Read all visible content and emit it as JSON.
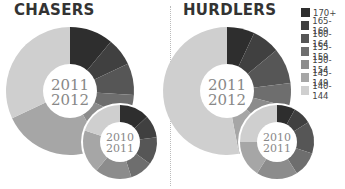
{
  "chart_data": {
    "type": "pie",
    "style": "donut",
    "legend": {
      "position": "right-top",
      "entries": [
        "170+",
        "165-169",
        "160-164",
        "155-159",
        "150-154",
        "145-149",
        "140-144"
      ],
      "colors": [
        "#2e2e2e",
        "#404040",
        "#565656",
        "#6e6e6e",
        "#8c8c8c",
        "#a6a6a6",
        "#cfcfcf"
      ]
    },
    "panels": [
      {
        "title": "CHASERS",
        "charts": [
          {
            "label_line1": "2011",
            "label_line2": "2012",
            "season": "2011/2012",
            "values": [
              11,
              7,
              8,
              6,
              10,
              26,
              32
            ]
          },
          {
            "label_line1": "2010",
            "label_line2": "2011",
            "season": "2010/2011",
            "values": [
              13,
              10,
              12,
              10,
              16,
              19,
              20
            ]
          }
        ]
      },
      {
        "title": "HURDLERS",
        "charts": [
          {
            "label_line1": "2011",
            "label_line2": "2012",
            "season": "2011/2012",
            "values": [
              7,
              7,
              9,
              6,
              8,
              10,
              53
            ]
          },
          {
            "label_line1": "2010",
            "label_line2": "2011",
            "season": "2010/2011",
            "values": [
              8,
              8,
              14,
              11,
              18,
              16,
              25
            ]
          }
        ]
      }
    ],
    "units": "% of horses by rating band (estimated)"
  }
}
